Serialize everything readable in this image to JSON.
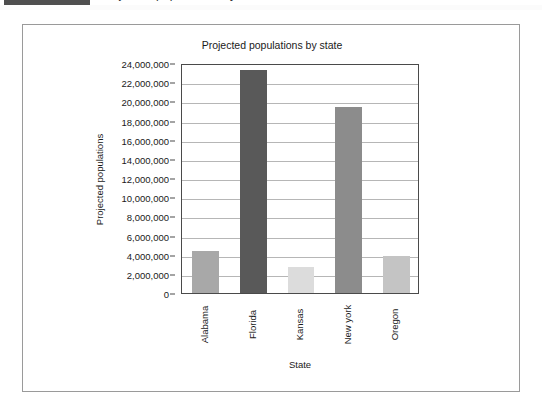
{
  "top_strip": {
    "clipped_text": "Projected populations by state",
    "selection_chip": ""
  },
  "chart_data": {
    "type": "bar",
    "title": "Projected populations by state",
    "xlabel": "State",
    "ylabel": "Projected populations",
    "categories": [
      "Alabama",
      "Florida",
      "Kansas",
      "New york",
      "Oregon"
    ],
    "values": [
      4400000,
      23300000,
      2700000,
      19400000,
      3900000
    ],
    "bar_colors": [
      "#a8a8a8",
      "#595959",
      "#dcdcdc",
      "#8c8c8c",
      "#c4c4c4"
    ],
    "ylim": [
      0,
      24000000
    ],
    "ytick_labels": [
      "24,000,000",
      "22,000,000",
      "20,000,000",
      "18,000,000",
      "16,000,000",
      "14,000,000",
      "12,000,000",
      "10,000,000",
      "8,000,000",
      "6,000,000",
      "4,000,000",
      "2,000,000",
      "0"
    ],
    "ytick_values": [
      24000000,
      22000000,
      20000000,
      18000000,
      16000000,
      14000000,
      12000000,
      10000000,
      8000000,
      6000000,
      4000000,
      2000000,
      0
    ],
    "grid": true,
    "legend": null,
    "legend_position": "none"
  }
}
